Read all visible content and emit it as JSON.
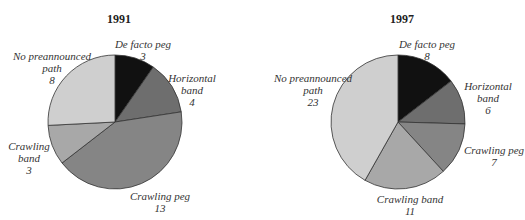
{
  "chart_data": [
    {
      "type": "pie",
      "title": "1991",
      "categories": [
        "De facto peg",
        "Horizontal band",
        "Crawling peg",
        "Crawling band",
        "No preannounced path"
      ],
      "values": [
        3,
        4,
        13,
        3,
        8
      ],
      "colors": [
        "#111111",
        "#6e6e6e",
        "#858585",
        "#a8a8a8",
        "#cfcfcf"
      ],
      "start_angle": "12 o'clock, clockwise"
    },
    {
      "type": "pie",
      "title": "1997",
      "categories": [
        "De facto peg",
        "Horizontal band",
        "Crawling peg",
        "Crawling band",
        "No preannounced path"
      ],
      "values": [
        8,
        6,
        7,
        11,
        23
      ],
      "colors": [
        "#111111",
        "#6e6e6e",
        "#858585",
        "#a8a8a8",
        "#cfcfcf"
      ],
      "start_angle": "12 o'clock, clockwise"
    }
  ],
  "charts": {
    "left": {
      "title": "1991",
      "labels": {
        "defacto": {
          "name": "De facto peg",
          "value": "3"
        },
        "horizontal": {
          "name1": "Horizontal",
          "name2": "band",
          "value": "4"
        },
        "crawlingpeg": {
          "name": "Crawling peg",
          "value": "13"
        },
        "crawlingband": {
          "name1": "Crawling",
          "name2": "band",
          "value": "3"
        },
        "nopath": {
          "name1": "No preannounced",
          "name2": "path",
          "value": "8"
        }
      }
    },
    "right": {
      "title": "1997",
      "labels": {
        "defacto": {
          "name": "De facto peg",
          "value": "8"
        },
        "horizontal": {
          "name1": "Horizontal",
          "name2": "band",
          "value": "6"
        },
        "crawlingpeg": {
          "name": "Crawling peg",
          "value": "7"
        },
        "crawlingband": {
          "name": "Crawling band",
          "value": "11"
        },
        "nopath": {
          "name1": "No preannounced",
          "name2": "path",
          "value": "23"
        }
      }
    }
  }
}
